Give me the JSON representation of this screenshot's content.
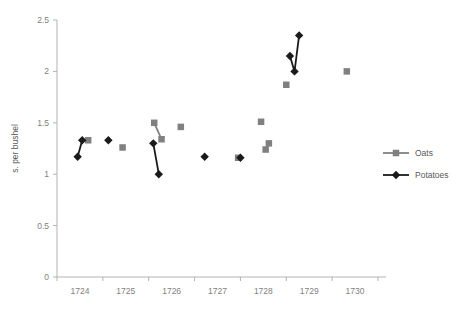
{
  "chart_data": {
    "type": "scatter",
    "title": "",
    "xlabel": "",
    "ylabel": "s. per bushel",
    "xlim": [
      1723.5,
      1730.5
    ],
    "ylim": [
      0,
      2.5
    ],
    "yticks": [
      "0",
      "0.5",
      "1",
      "1.5",
      "2",
      "2.5"
    ],
    "ytick_values": [
      0,
      0.5,
      1,
      1.5,
      2,
      2.5
    ],
    "xticks": [
      "1724",
      "1725",
      "1726",
      "1727",
      "1728",
      "1729",
      "1730"
    ],
    "xtick_values": [
      1724,
      1725,
      1726,
      1727,
      1728,
      1729,
      1730
    ],
    "grid": false,
    "legend_position": "right",
    "series": [
      {
        "name": "Oats",
        "color": "#808080",
        "marker": "square",
        "segments": [
          [
            {
              "x": 1724.18,
              "y": 1.33
            }
          ],
          [
            {
              "x": 1724.93,
              "y": 1.26
            }
          ],
          [
            {
              "x": 1725.62,
              "y": 1.5
            },
            {
              "x": 1725.78,
              "y": 1.34
            }
          ],
          [
            {
              "x": 1726.2,
              "y": 1.46
            }
          ],
          [
            {
              "x": 1727.45,
              "y": 1.16
            }
          ],
          [
            {
              "x": 1727.95,
              "y": 1.51
            }
          ],
          [
            {
              "x": 1728.05,
              "y": 1.24
            },
            {
              "x": 1728.12,
              "y": 1.3
            }
          ],
          [
            {
              "x": 1728.5,
              "y": 1.87
            }
          ],
          [
            {
              "x": 1729.82,
              "y": 2.0
            }
          ]
        ]
      },
      {
        "name": "Potatoes",
        "color": "#1a1a1a",
        "marker": "diamond",
        "segments": [
          [
            {
              "x": 1723.95,
              "y": 1.17
            },
            {
              "x": 1724.05,
              "y": 1.33
            }
          ],
          [
            {
              "x": 1724.62,
              "y": 1.33
            }
          ],
          [
            {
              "x": 1725.6,
              "y": 1.3
            },
            {
              "x": 1725.72,
              "y": 1.0
            }
          ],
          [
            {
              "x": 1726.72,
              "y": 1.17
            }
          ],
          [
            {
              "x": 1727.5,
              "y": 1.16
            }
          ],
          [
            {
              "x": 1728.58,
              "y": 2.15
            },
            {
              "x": 1728.68,
              "y": 2.0
            },
            {
              "x": 1728.78,
              "y": 2.35
            }
          ]
        ]
      }
    ],
    "legend": [
      {
        "label": "Oats",
        "color": "#808080",
        "marker": "square"
      },
      {
        "label": "Potatoes",
        "color": "#1a1a1a",
        "marker": "diamond"
      }
    ]
  }
}
